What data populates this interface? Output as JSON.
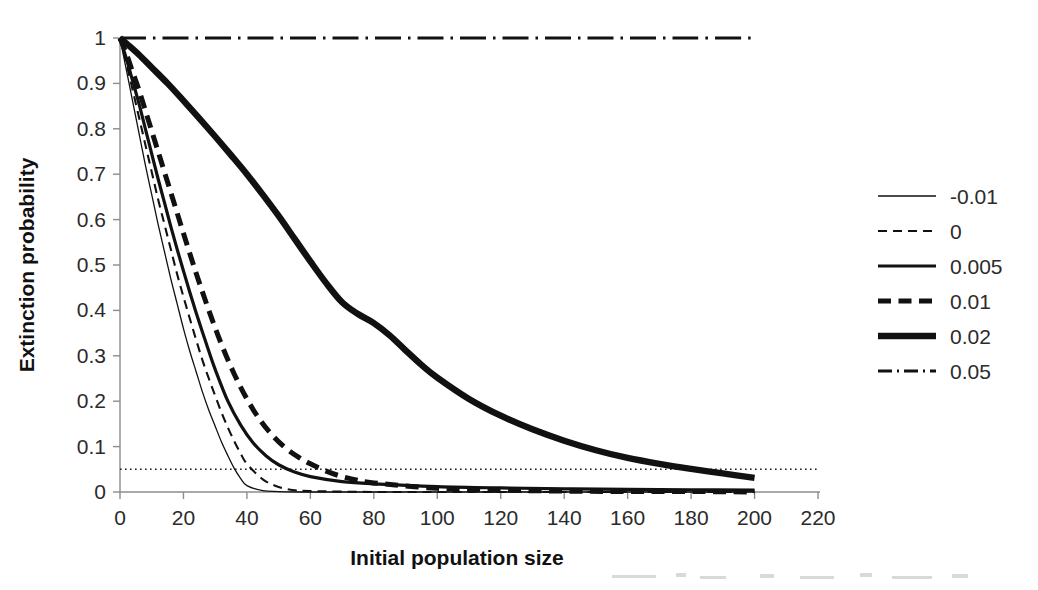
{
  "chart_data": {
    "type": "line",
    "title": "",
    "xlabel": "Initial population size",
    "ylabel": "Extinction probability",
    "xlim": [
      0,
      220
    ],
    "ylim": [
      0,
      1
    ],
    "xticks": [
      0,
      20,
      40,
      60,
      80,
      100,
      120,
      140,
      160,
      180,
      200,
      220
    ],
    "xtick_labels": [
      "0",
      "20",
      "40",
      "60",
      "80",
      "100",
      "120",
      "140",
      "160",
      "180",
      "200",
      "220"
    ],
    "yticks": [
      0,
      0.1,
      0.2,
      0.3,
      0.4,
      0.5,
      0.6,
      0.7,
      0.8,
      0.9,
      1
    ],
    "ytick_labels": [
      "0",
      "0.1",
      "0.2",
      "0.3",
      "0.4",
      "0.5",
      "0.6",
      "0.7",
      "0.8",
      "0.9",
      "1"
    ],
    "grid": false,
    "legend_position": "right",
    "legend_title": "",
    "reference_lines": [
      {
        "name": "quasi-extinction-threshold",
        "orientation": "horizontal",
        "value": 0.05,
        "style": "dotted",
        "label": ""
      }
    ],
    "series": [
      {
        "name": "-0.01",
        "label": "-0.01",
        "style": "solid",
        "width": 1.3,
        "color": "#111111",
        "x": [
          0,
          2,
          4,
          6,
          8,
          10,
          12,
          14,
          16,
          18,
          20,
          22,
          24,
          26,
          28,
          30,
          32,
          34,
          36,
          38,
          40,
          45,
          50,
          60,
          80,
          100,
          120,
          140,
          160,
          180,
          200
        ],
        "y": [
          1,
          0.93,
          0.86,
          0.79,
          0.72,
          0.655,
          0.59,
          0.53,
          0.47,
          0.415,
          0.36,
          0.31,
          0.265,
          0.22,
          0.18,
          0.145,
          0.11,
          0.08,
          0.052,
          0.03,
          0.014,
          0.003,
          0.001,
          0,
          0,
          0,
          0,
          0,
          0,
          0,
          0
        ]
      },
      {
        "name": "0",
        "label": "0",
        "style": "dashed",
        "width": 2.1,
        "color": "#111111",
        "x": [
          0,
          2,
          4,
          6,
          8,
          10,
          12,
          14,
          16,
          18,
          20,
          22,
          24,
          26,
          28,
          30,
          32,
          34,
          36,
          38,
          40,
          45,
          50,
          55,
          60,
          80,
          100,
          120,
          140,
          160,
          180,
          200
        ],
        "y": [
          1,
          0.945,
          0.885,
          0.825,
          0.765,
          0.705,
          0.645,
          0.59,
          0.535,
          0.48,
          0.43,
          0.382,
          0.335,
          0.29,
          0.25,
          0.212,
          0.175,
          0.142,
          0.112,
          0.085,
          0.062,
          0.028,
          0.011,
          0.004,
          0.002,
          0,
          0,
          0,
          0,
          0,
          0,
          0
        ]
      },
      {
        "name": "0.005",
        "label": "0.005",
        "style": "solid",
        "width": 3.2,
        "color": "#111111",
        "x": [
          0,
          2,
          4,
          6,
          8,
          10,
          12,
          14,
          16,
          18,
          20,
          22,
          24,
          26,
          28,
          30,
          34,
          38,
          42,
          46,
          50,
          55,
          60,
          70,
          80,
          100,
          120,
          140,
          160,
          180,
          200
        ],
        "y": [
          1,
          0.955,
          0.905,
          0.855,
          0.8,
          0.745,
          0.69,
          0.638,
          0.585,
          0.535,
          0.487,
          0.44,
          0.395,
          0.352,
          0.31,
          0.27,
          0.2,
          0.148,
          0.108,
          0.08,
          0.06,
          0.044,
          0.034,
          0.023,
          0.018,
          0.012,
          0.009,
          0.007,
          0.006,
          0.005,
          0.004
        ]
      },
      {
        "name": "0.01",
        "label": "0.01",
        "style": "dashed",
        "width": 5.0,
        "color": "#111111",
        "x": [
          0,
          2,
          4,
          6,
          8,
          10,
          12,
          14,
          16,
          18,
          20,
          24,
          28,
          32,
          36,
          40,
          44,
          48,
          52,
          56,
          60,
          65,
          70,
          75,
          80,
          100,
          120,
          140,
          160,
          180,
          200
        ],
        "y": [
          1,
          0.965,
          0.925,
          0.885,
          0.84,
          0.795,
          0.75,
          0.705,
          0.66,
          0.615,
          0.57,
          0.482,
          0.4,
          0.325,
          0.26,
          0.205,
          0.16,
          0.125,
          0.098,
          0.078,
          0.062,
          0.046,
          0.034,
          0.026,
          0.02,
          0.008,
          0.004,
          0.002,
          0.001,
          0.001,
          0
        ]
      },
      {
        "name": "0.02",
        "label": "0.02",
        "style": "solid",
        "width": 6.4,
        "color": "#111111",
        "x": [
          0,
          3,
          6,
          10,
          15,
          20,
          25,
          30,
          35,
          40,
          45,
          50,
          55,
          60,
          65,
          70,
          75,
          80,
          85,
          90,
          95,
          100,
          110,
          120,
          130,
          140,
          150,
          160,
          170,
          180,
          190,
          200
        ],
        "y": [
          1,
          0.982,
          0.963,
          0.935,
          0.9,
          0.862,
          0.823,
          0.783,
          0.742,
          0.7,
          0.655,
          0.608,
          0.558,
          0.508,
          0.46,
          0.418,
          0.392,
          0.372,
          0.345,
          0.312,
          0.28,
          0.252,
          0.205,
          0.168,
          0.138,
          0.113,
          0.092,
          0.075,
          0.062,
          0.051,
          0.041,
          0.031
        ]
      },
      {
        "name": "0.05",
        "label": "0.05",
        "style": "dashdot",
        "width": 3.0,
        "color": "#111111",
        "x": [
          0,
          20,
          40,
          60,
          80,
          100,
          120,
          140,
          160,
          180,
          200
        ],
        "y": [
          1,
          1,
          1,
          1,
          1,
          1,
          1,
          1,
          1,
          1,
          1
        ]
      }
    ]
  },
  "legend": {
    "items": [
      {
        "label": "-0.01"
      },
      {
        "label": "0"
      },
      {
        "label": "0.005"
      },
      {
        "label": "0.01"
      },
      {
        "label": "0.02"
      },
      {
        "label": "0.05"
      }
    ]
  },
  "axes": {
    "x_title": "Initial population size",
    "y_title": "Extinction probability"
  }
}
